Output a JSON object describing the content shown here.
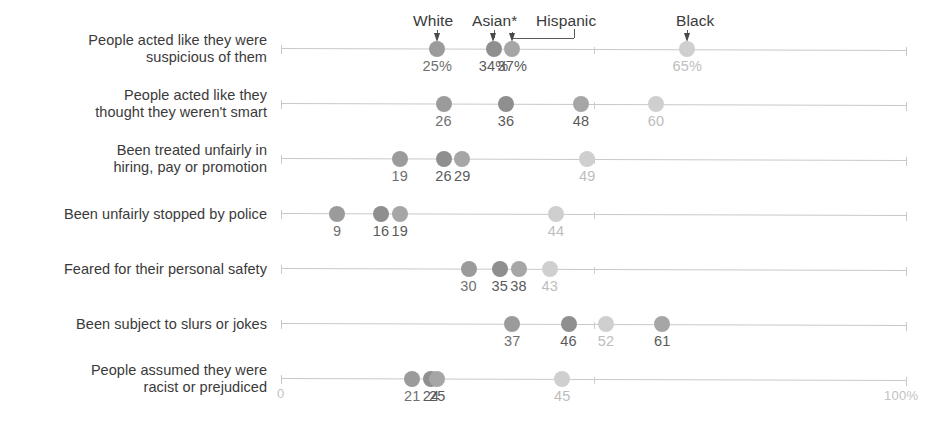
{
  "chart_data": {
    "type": "scatter",
    "title": "",
    "xlabel": "",
    "ylabel": "",
    "xlim": [
      0,
      100
    ],
    "grid": false,
    "legend_position": "top",
    "axis_start_label": "0",
    "axis_end_label": "100%",
    "series": [
      {
        "name": "White",
        "color": "#9b9b9b",
        "label_color": "#6f6f6f"
      },
      {
        "name": "Asian*",
        "color": "#8f8f8f",
        "label_color": "#5a5a5a"
      },
      {
        "name": "Hispanic",
        "color": "#a6a6a6",
        "label_color": "#5a5a5a"
      },
      {
        "name": "Black",
        "color": "#cfcfcf",
        "label_color": "#bdbdbd"
      }
    ],
    "categories": [
      "People acted like they were suspicious of them",
      "People acted like they thought they weren't smart",
      "Been treated unfairly in hiring, pay or promotion",
      "Been unfairly stopped by police",
      "Feared for their personal safety",
      "Been subject to slurs or jokes",
      "People assumed they were racist or prejudiced"
    ],
    "rows": [
      {
        "label_line1": "People acted like they were",
        "label_line2": "suspicious of them",
        "points": [
          {
            "series": "White",
            "value": 25,
            "display": "25%"
          },
          {
            "series": "Asian*",
            "value": 34,
            "display": "34%"
          },
          {
            "series": "Hispanic",
            "value": 37,
            "display": "37%"
          },
          {
            "series": "Black",
            "value": 65,
            "display": "65%"
          }
        ]
      },
      {
        "label_line1": "People acted like they",
        "label_line2": "thought they weren't smart",
        "points": [
          {
            "series": "White",
            "value": 26,
            "display": "26"
          },
          {
            "series": "Asian*",
            "value": 36,
            "display": "36"
          },
          {
            "series": "Hispanic",
            "value": 48,
            "display": "48"
          },
          {
            "series": "Black",
            "value": 60,
            "display": "60"
          }
        ]
      },
      {
        "label_line1": "Been treated unfairly in",
        "label_line2": "hiring, pay or promotion",
        "points": [
          {
            "series": "White",
            "value": 19,
            "display": "19"
          },
          {
            "series": "Asian*",
            "value": 26,
            "display": "26"
          },
          {
            "series": "Hispanic",
            "value": 29,
            "display": "29"
          },
          {
            "series": "Black",
            "value": 49,
            "display": "49"
          }
        ]
      },
      {
        "label_line1": "Been unfairly stopped by police",
        "label_line2": "",
        "points": [
          {
            "series": "White",
            "value": 9,
            "display": "9"
          },
          {
            "series": "Asian*",
            "value": 16,
            "display": "16"
          },
          {
            "series": "Hispanic",
            "value": 19,
            "display": "19"
          },
          {
            "series": "Black",
            "value": 44,
            "display": "44"
          }
        ]
      },
      {
        "label_line1": "Feared for their personal safety",
        "label_line2": "",
        "points": [
          {
            "series": "White",
            "value": 30,
            "display": "30"
          },
          {
            "series": "Asian*",
            "value": 35,
            "display": "35"
          },
          {
            "series": "Hispanic",
            "value": 38,
            "display": "38"
          },
          {
            "series": "Black",
            "value": 43,
            "display": "43"
          }
        ]
      },
      {
        "label_line1": "Been subject to slurs or jokes",
        "label_line2": "",
        "points": [
          {
            "series": "White",
            "value": 37,
            "display": "37"
          },
          {
            "series": "Asian*",
            "value": 46,
            "display": "46"
          },
          {
            "series": "Black",
            "value": 52,
            "display": "52"
          },
          {
            "series": "Hispanic",
            "value": 61,
            "display": "61"
          }
        ]
      },
      {
        "label_line1": "People assumed they were",
        "label_line2": "racist or prejudiced",
        "points": [
          {
            "series": "White",
            "value": 21,
            "display": "21"
          },
          {
            "series": "Asian*",
            "value": 24,
            "display": "24"
          },
          {
            "series": "Hispanic",
            "value": 25,
            "display": "25"
          },
          {
            "series": "Black",
            "value": 45,
            "display": "45"
          }
        ]
      }
    ]
  },
  "legend": {
    "items": [
      {
        "label": "White",
        "value": 25
      },
      {
        "label": "Asian*",
        "value": 34
      },
      {
        "label": "Hispanic",
        "value": 37
      },
      {
        "label": "Black",
        "value": 65
      }
    ]
  }
}
